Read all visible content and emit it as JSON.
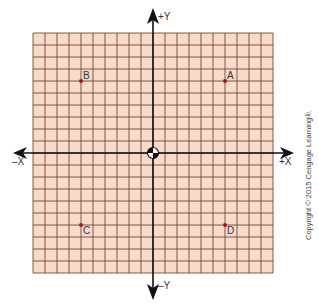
{
  "axes": {
    "x_positive_label": "+X",
    "x_negative_label": "–X",
    "y_positive_label": "+Y",
    "y_negative_label": "–Y"
  },
  "grid": {
    "cells": 20,
    "fill_color": "#f9d9c8",
    "line_color": "#5a3a2a",
    "point_color": "#b01010"
  },
  "points": [
    {
      "label": "A",
      "x": 6,
      "y": 6
    },
    {
      "label": "B",
      "x": -6,
      "y": 6
    },
    {
      "label": "C",
      "x": -6,
      "y": -6
    },
    {
      "label": "D",
      "x": 6,
      "y": -6
    }
  ],
  "copyright": "Copyright © 2015 Cengage Learning®."
}
